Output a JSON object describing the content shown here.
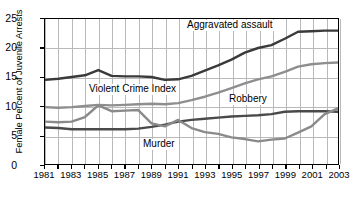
{
  "chart_data": {
    "type": "line",
    "title": "",
    "xlabel": "",
    "ylabel": "Female Percent of Juvenile Arrests",
    "xlim": [
      1981,
      2003
    ],
    "ylim": [
      0,
      25
    ],
    "yticks": [
      0,
      5,
      10,
      15,
      20,
      25
    ],
    "xticks": [
      1981,
      1983,
      1985,
      1987,
      1989,
      1991,
      1993,
      1995,
      1997,
      1999,
      2001,
      2003
    ],
    "x": [
      1981,
      1982,
      1983,
      1984,
      1985,
      1986,
      1987,
      1988,
      1989,
      1990,
      1991,
      1992,
      1993,
      1994,
      1995,
      1996,
      1997,
      1998,
      1999,
      2000,
      2001,
      2002,
      2003
    ],
    "grid": true,
    "legend_position": "inline-annotations",
    "series": [
      {
        "name": "Aggravated assault",
        "color": "#3a3a3a",
        "values": [
          14.5,
          14.7,
          15.0,
          15.3,
          16.2,
          15.2,
          15.1,
          15.1,
          15.0,
          14.5,
          14.6,
          15.2,
          16.1,
          17.0,
          18.0,
          19.2,
          20.0,
          20.5,
          21.6,
          22.8,
          22.9,
          23.0,
          23.0
        ]
      },
      {
        "name": "Violent Crime Index",
        "color": "#8e8e8e",
        "values": [
          9.8,
          9.7,
          9.8,
          10.0,
          10.2,
          10.1,
          10.2,
          10.3,
          10.4,
          10.3,
          10.5,
          11.0,
          11.6,
          12.3,
          13.1,
          13.9,
          14.6,
          15.1,
          15.9,
          16.8,
          17.2,
          17.4,
          17.5
        ]
      },
      {
        "name": "Robbery",
        "color": "#4a4a4a",
        "values": [
          6.3,
          6.2,
          6.0,
          6.0,
          6.0,
          6.0,
          6.0,
          6.1,
          6.4,
          6.8,
          7.3,
          7.6,
          7.8,
          8.0,
          8.2,
          8.3,
          8.4,
          8.6,
          9.0,
          9.1,
          9.1,
          9.1,
          9.0
        ]
      },
      {
        "name": "Murder",
        "color": "#8a8a8a",
        "values": [
          7.3,
          7.2,
          7.3,
          8.1,
          10.1,
          9.1,
          9.2,
          9.3,
          7.0,
          6.5,
          7.6,
          6.2,
          5.5,
          5.2,
          4.6,
          4.3,
          3.9,
          4.2,
          4.4,
          5.4,
          6.5,
          8.6,
          9.6
        ]
      }
    ],
    "annotations": [
      {
        "text": "Aggravated assault",
        "x_px": 186,
        "y_px": 20
      },
      {
        "text": "Violent Crime Index",
        "x_px": 88,
        "y_px": 84
      },
      {
        "text": "Robbery",
        "x_px": 228,
        "y_px": 94
      },
      {
        "text": "Murder",
        "x_px": 142,
        "y_px": 139
      }
    ]
  }
}
